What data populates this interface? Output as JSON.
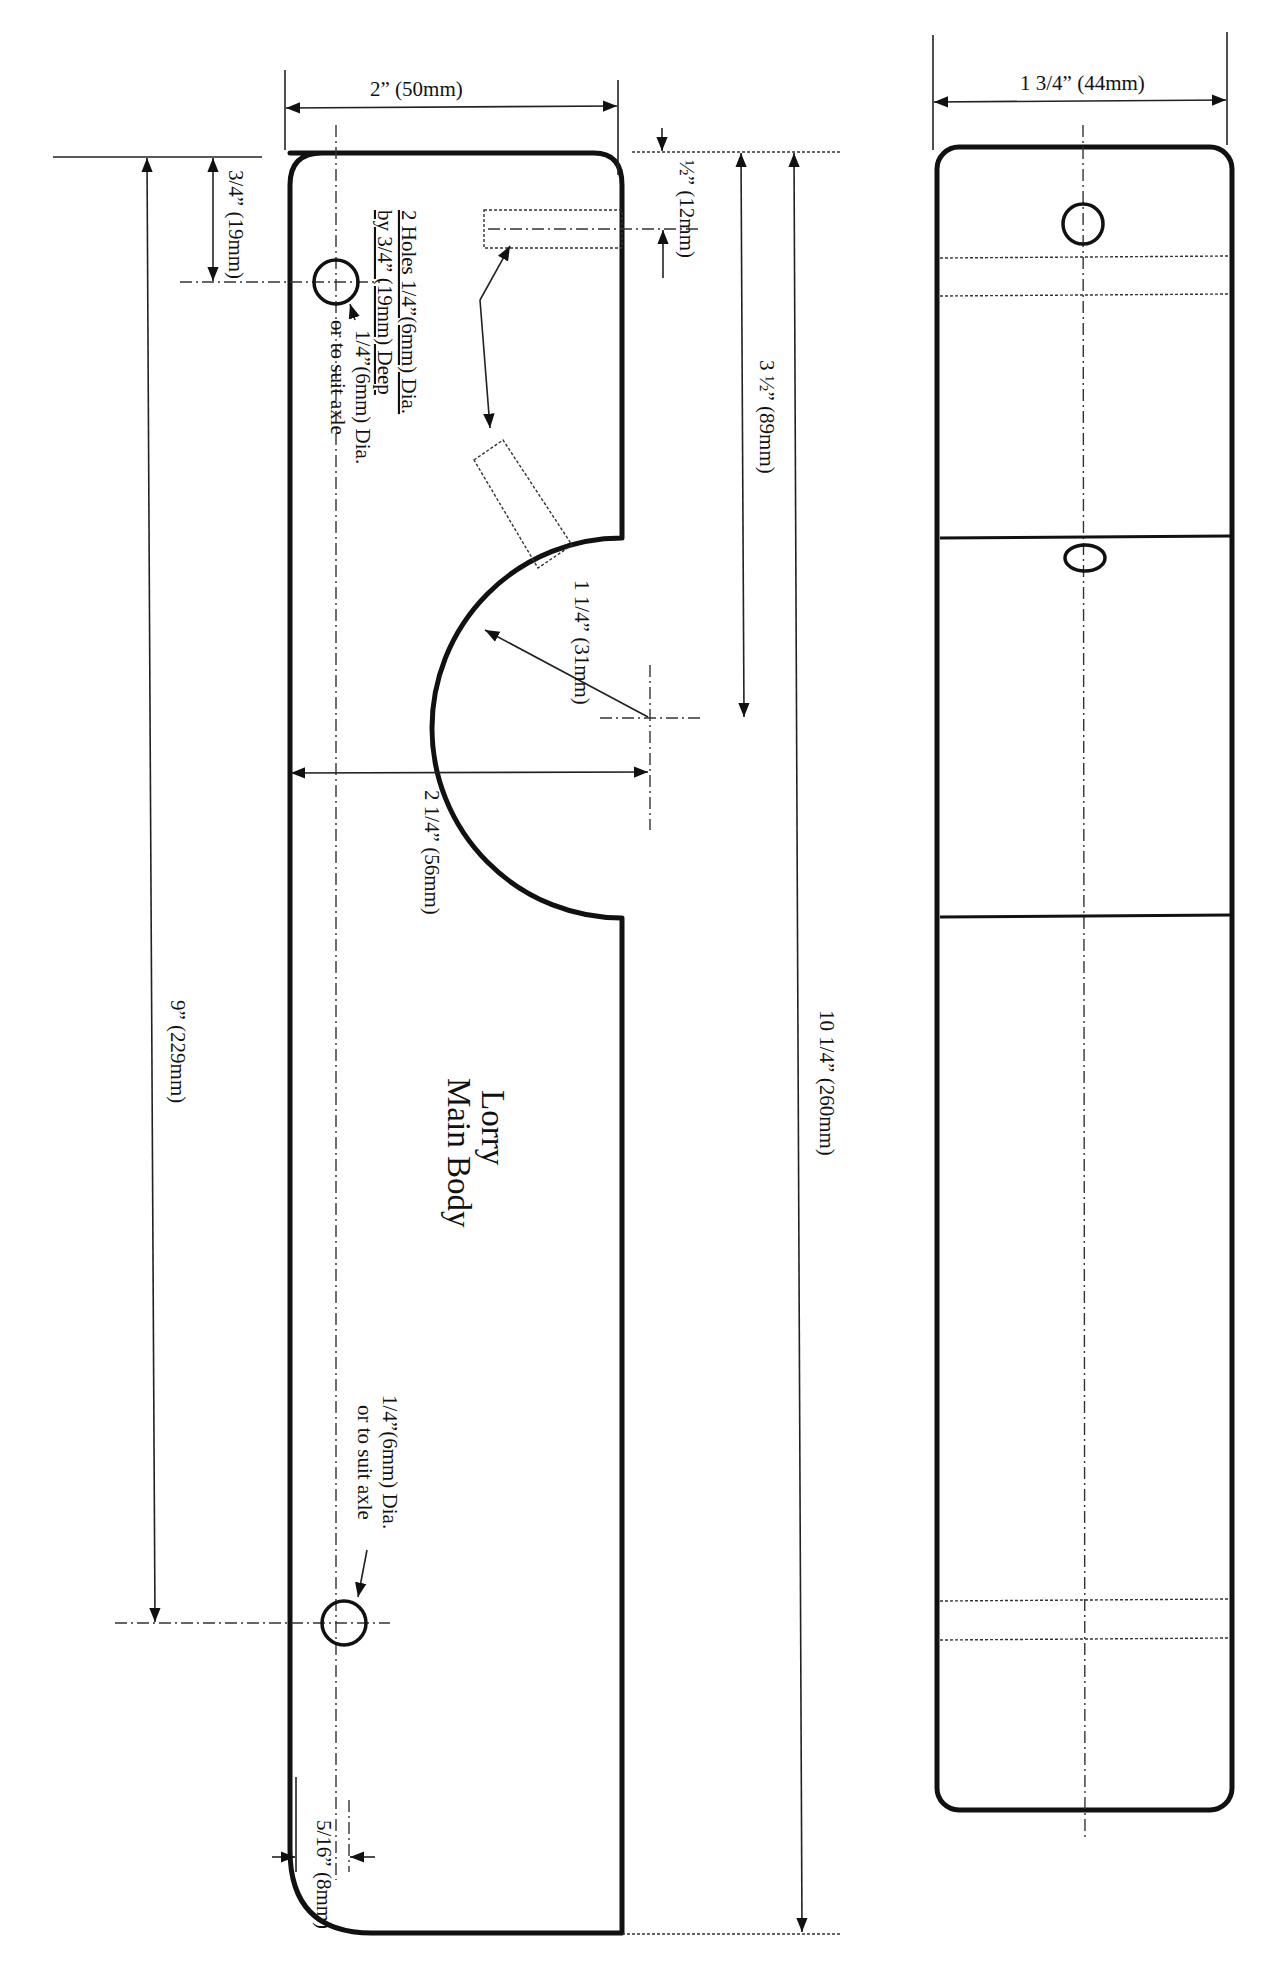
{
  "drawing": {
    "title_line1": "Lorry",
    "title_line2": "Main Body",
    "line_color": "#111111",
    "background": "#ffffff"
  },
  "side_view": {
    "dimensions": {
      "width_top": "2” (50mm)",
      "front_hole_offset": "3/4” (19mm)",
      "axle_spacing": "9” (229mm)",
      "dowel_offset": "½” (12mm)",
      "cutout_center": "3 ½” (89mm)",
      "overall_length": "10 1/4” (260mm)",
      "cutout_radius": "1 1/4” (31mm)",
      "cutout_width": "2 1/4” (56mm)",
      "rear_hole_offset": "5/16” (8mm)"
    },
    "notes": {
      "dowel_holes_line1": "2 Holes 1/4”(6mm) Dia.",
      "dowel_holes_line2": "by 3/4” (19mm) Deep",
      "front_axle_line1": "1/4”(6mm) Dia.",
      "front_axle_line2": "or to suit axle",
      "rear_axle_line1": "1/4”(6mm) Dia.",
      "rear_axle_line2": "or to suit axle"
    }
  },
  "top_view": {
    "dimensions": {
      "width": "1 3/4” (44mm)"
    }
  }
}
